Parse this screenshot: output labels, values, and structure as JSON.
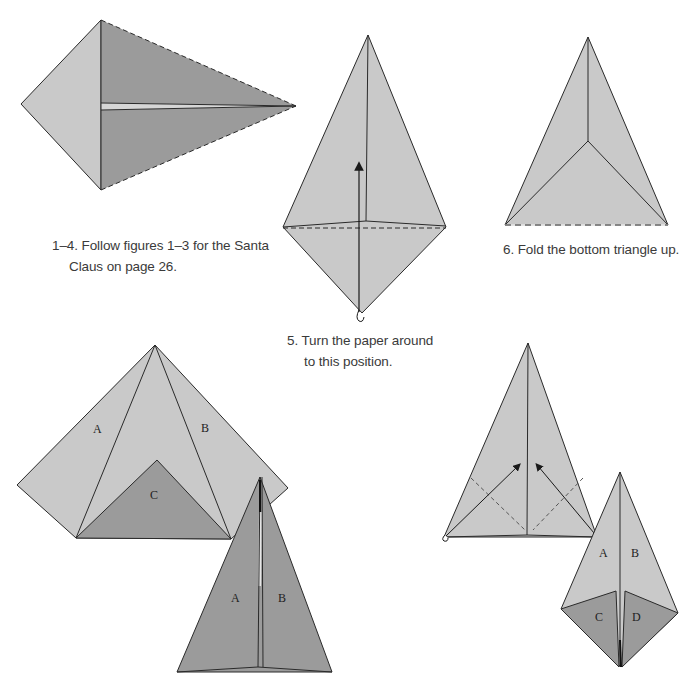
{
  "colors": {
    "paper_light": "#c9c9c9",
    "paper_dark": "#9b9b9b",
    "line": "#2a2a2a",
    "text": "#3a3a3a"
  },
  "steps": [
    {
      "id": "1-4",
      "caption_line1": "1–4. Follow figures 1–3 for the Santa",
      "caption_line2": "Claus on page 26."
    },
    {
      "id": "5",
      "caption_line1": "5. Turn the paper around",
      "caption_line2": "to this position."
    },
    {
      "id": "6",
      "caption_line1": "6. Fold the bottom triangle up."
    }
  ],
  "figure_labels": {
    "fig7": {
      "a": "A",
      "b": "B",
      "c": "C"
    },
    "fig8": {
      "a": "A",
      "b": "B"
    },
    "fig10": {
      "a": "A",
      "b": "B",
      "c": "C",
      "d": "D"
    }
  }
}
